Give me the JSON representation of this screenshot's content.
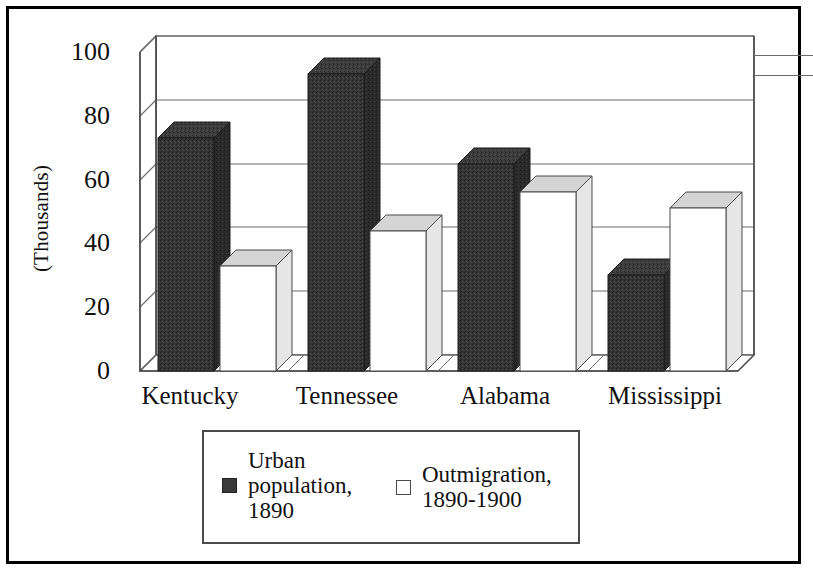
{
  "figure": {
    "y_axis_title": "(Thousands)",
    "y_ticks": [
      "100",
      "80",
      "60",
      "40",
      "20",
      "0"
    ],
    "x_labels": [
      "Kentucky",
      "Tennessee",
      "Alabama",
      "Mississippi"
    ]
  },
  "legend": {
    "items": [
      {
        "label": "Urban\npopulation,\n1890",
        "swatch": "dark",
        "color": "#3a3a3a"
      },
      {
        "label": "Outmigration,\n1890-1900",
        "swatch": "light",
        "color": "#ffffff"
      }
    ]
  },
  "colors": {
    "series_urban": "#3a3a3a",
    "series_outmigration": "#ffffff",
    "frame": "#000000",
    "gridline": "#6a6a6a"
  },
  "chart_data": {
    "type": "bar",
    "title": "",
    "subtitle": "",
    "xlabel": "",
    "ylabel": "(Thousands)",
    "categories": [
      "Kentucky",
      "Tennessee",
      "Alabama",
      "Mississippi"
    ],
    "series": [
      {
        "name": "Urban population, 1890",
        "color": "#3a3a3a",
        "values": [
          73,
          93,
          65,
          30
        ]
      },
      {
        "name": "Outmigration, 1890-1900",
        "color": "#ffffff",
        "values": [
          33,
          44,
          56,
          51
        ]
      }
    ],
    "ylim": [
      0,
      100
    ],
    "ytick_values": [
      0,
      20,
      40,
      60,
      80,
      100
    ],
    "grid": true,
    "legend_position": "bottom",
    "projection": "3d-column",
    "units": "thousands"
  }
}
